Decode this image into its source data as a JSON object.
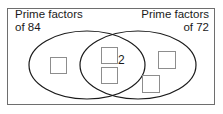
{
  "diagram": {
    "type": "venn-diagram",
    "title_visible": false,
    "frame": {
      "x": 7,
      "y": 8,
      "width": 208,
      "height": 97,
      "border_color": "#6e6e6e",
      "fill_color": "#ffffff"
    },
    "sets": [
      {
        "id": "left-set",
        "label_lines": [
          "Prime factors",
          "of 84"
        ],
        "label_text": "Prime factors of 84",
        "align": "left",
        "ellipse": {
          "cx": 87,
          "cy": 65,
          "rx": 58,
          "ry": 34
        },
        "stroke_color": "#1a1a1a"
      },
      {
        "id": "right-set",
        "label_lines": [
          "Prime factors",
          "of 72"
        ],
        "label_text": "Prime factors of 72",
        "align": "right",
        "ellipse": {
          "cx": 138,
          "cy": 65,
          "rx": 58,
          "ry": 34
        },
        "stroke_color": "#1a1a1a"
      }
    ],
    "intersection": {
      "label": "2",
      "label_x": 118,
      "label_y": 54
    },
    "answer_boxes": [
      {
        "id": "box-left-1",
        "region": "left-only",
        "x": 50,
        "y": 57,
        "width": 17,
        "height": 17,
        "value": ""
      },
      {
        "id": "box-mid-1",
        "region": "intersection",
        "x": 101,
        "y": 47,
        "width": 17,
        "height": 17,
        "value": ""
      },
      {
        "id": "box-mid-2",
        "region": "intersection",
        "x": 101,
        "y": 67,
        "width": 17,
        "height": 17,
        "value": ""
      },
      {
        "id": "box-right-1",
        "region": "right-only",
        "x": 158,
        "y": 51,
        "width": 18,
        "height": 18,
        "value": ""
      },
      {
        "id": "box-right-2",
        "region": "right-only",
        "x": 142,
        "y": 75,
        "width": 18,
        "height": 18,
        "value": ""
      }
    ],
    "box_style": {
      "border_color": "#8d8d8d",
      "fill_color": "#ffffff"
    }
  }
}
